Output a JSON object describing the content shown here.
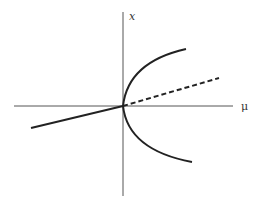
{
  "diagram": {
    "type": "pitchfork-bifurcation",
    "axes": {
      "horizontal_label": "μ",
      "vertical_label": "x"
    },
    "branches": [
      {
        "name": "trivial-stable",
        "style": "solid"
      },
      {
        "name": "trivial-unstable",
        "style": "dashed"
      },
      {
        "name": "parabola-stable",
        "style": "solid"
      }
    ],
    "colors": {
      "axis": "#555555",
      "curve": "#222222",
      "background": "#ffffff"
    }
  }
}
